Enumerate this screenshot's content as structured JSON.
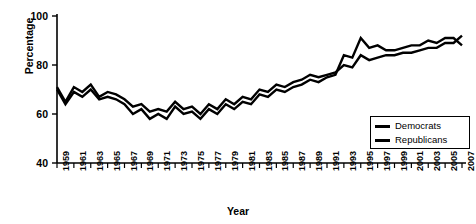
{
  "chart_data": {
    "type": "line",
    "title": "",
    "xlabel": "Year",
    "ylabel": "Percentage",
    "ylim": [
      40,
      100
    ],
    "yticks": [
      40,
      60,
      80,
      100
    ],
    "xlim": [
      1959,
      2007
    ],
    "xticks": [
      1959,
      1961,
      1963,
      1965,
      1967,
      1969,
      1971,
      1973,
      1975,
      1977,
      1979,
      1981,
      1983,
      1985,
      1987,
      1989,
      1991,
      1993,
      1995,
      1997,
      1999,
      2001,
      2003,
      2005,
      2007
    ],
    "grid": false,
    "legend_position": "bottom-right",
    "x": [
      1959,
      1960,
      1961,
      1962,
      1963,
      1964,
      1965,
      1966,
      1967,
      1968,
      1969,
      1970,
      1971,
      1972,
      1973,
      1974,
      1975,
      1976,
      1977,
      1978,
      1979,
      1980,
      1981,
      1982,
      1983,
      1984,
      1985,
      1986,
      1987,
      1988,
      1989,
      1990,
      1991,
      1992,
      1993,
      1994,
      1995,
      1996,
      1997,
      1998,
      1999,
      2000,
      2001,
      2002,
      2003,
      2004,
      2005,
      2006,
      2007
    ],
    "series": [
      {
        "name": "Democrats",
        "color": "#000000",
        "values": [
          71,
          65,
          71,
          69,
          72,
          67,
          69,
          68,
          66,
          63,
          64,
          61,
          62,
          61,
          65,
          62,
          63,
          60,
          64,
          62,
          66,
          64,
          67,
          66,
          70,
          69,
          72,
          71,
          73,
          74,
          76,
          75,
          76,
          77,
          80,
          79,
          84,
          82,
          83,
          84,
          84,
          85,
          85,
          86,
          87,
          87,
          89,
          89,
          92
        ]
      },
      {
        "name": "Republicans",
        "color": "#000000",
        "values": [
          70,
          64,
          69,
          67,
          70,
          66,
          67,
          66,
          64,
          60,
          62,
          58,
          60,
          58,
          63,
          60,
          61,
          58,
          62,
          60,
          64,
          62,
          65,
          64,
          68,
          67,
          70,
          69,
          71,
          72,
          74,
          73,
          75,
          76,
          84,
          83,
          91,
          87,
          88,
          86,
          86,
          87,
          88,
          88,
          90,
          89,
          91,
          91,
          88
        ]
      }
    ]
  },
  "legend": {
    "items": [
      {
        "label": "Democrats"
      },
      {
        "label": "Republicans"
      }
    ]
  },
  "axes": {
    "y_title": "Percentage",
    "x_title": "Year",
    "y_tick_labels": [
      "100",
      "80",
      "60",
      "40"
    ],
    "x_tick_labels": [
      "1959",
      "1961",
      "1963",
      "1965",
      "1967",
      "1969",
      "1971",
      "1973",
      "1975",
      "1977",
      "1979",
      "1981",
      "1983",
      "1985",
      "1987",
      "1989",
      "1991",
      "1993",
      "1995",
      "1997",
      "1999",
      "2001",
      "2003",
      "2005",
      "2007"
    ]
  }
}
